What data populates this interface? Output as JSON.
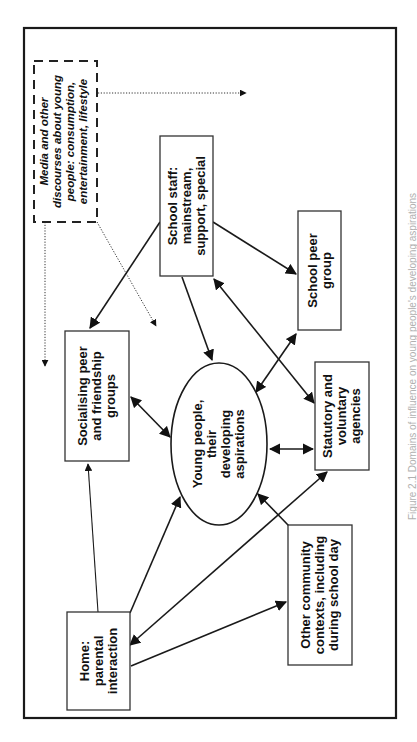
{
  "diagram": {
    "orientation": "rotated-90-ccw",
    "nodes": {
      "media": {
        "style": "dashed-italic",
        "lines": [
          "Media and other",
          "discourses about young",
          "people: consumption,",
          "entertainment, lifestyle"
        ]
      },
      "school_staff": {
        "lines": [
          "School staff:",
          "mainstream,",
          "support, special"
        ]
      },
      "school_peer": {
        "lines": [
          "School peer",
          "group"
        ]
      },
      "socialising": {
        "lines": [
          "Socialising peer",
          "and friendship",
          "groups"
        ]
      },
      "young_people": {
        "shape": "ellipse",
        "lines": [
          "Young people,",
          "their",
          "developing",
          "aspirations"
        ]
      },
      "statutory": {
        "lines": [
          "Statutory and",
          "voluntary",
          "agencies"
        ]
      },
      "home": {
        "lines": [
          "Home:",
          "parental",
          "interaction"
        ]
      },
      "community": {
        "lines": [
          "Other community",
          "contexts, including",
          "during school day"
        ]
      }
    },
    "edges": [
      {
        "from": "media",
        "to": "outside-right",
        "style": "dotted"
      },
      {
        "from": "media",
        "to": "outside-left",
        "style": "dotted"
      },
      {
        "from": "media",
        "to": "young_people-area",
        "style": "dotted"
      },
      {
        "from": "school_staff",
        "to": "socialising",
        "style": "solid"
      },
      {
        "from": "school_staff",
        "to": "school_peer",
        "style": "solid"
      },
      {
        "from": "school_staff",
        "to": "young_people",
        "style": "solid"
      },
      {
        "from": "school_staff",
        "to": "statutory",
        "style": "solid",
        "bidirectional": true
      },
      {
        "from": "school_peer",
        "to": "young_people",
        "style": "solid",
        "bidirectional": true
      },
      {
        "from": "socialising",
        "to": "young_people",
        "style": "solid",
        "bidirectional": true
      },
      {
        "from": "young_people",
        "to": "statutory",
        "style": "solid",
        "bidirectional": true
      },
      {
        "from": "home",
        "to": "socialising",
        "style": "solid"
      },
      {
        "from": "home",
        "to": "young_people",
        "style": "solid"
      },
      {
        "from": "home",
        "to": "statutory",
        "style": "solid",
        "bidirectional": true
      },
      {
        "from": "home",
        "to": "community",
        "style": "solid"
      },
      {
        "from": "community",
        "to": "young_people",
        "style": "solid"
      }
    ],
    "caption": "Figure 2.1 Domains of influence on young people's developing aspirations"
  }
}
